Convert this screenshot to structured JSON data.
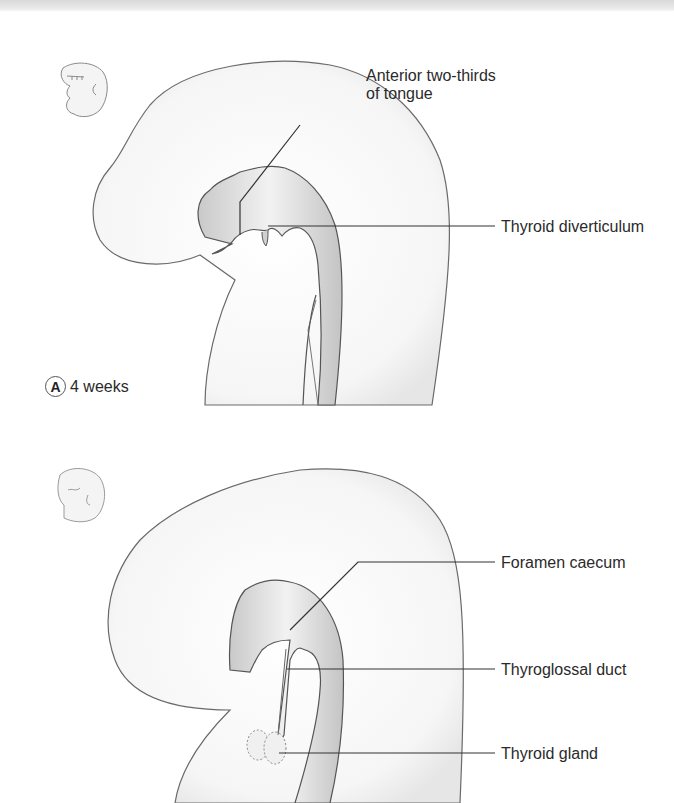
{
  "figure": {
    "panel_a": {
      "letter": "A",
      "age": "4 weeks",
      "labels": {
        "tongue_line1": "Anterior two-thirds",
        "tongue_line2": "of tongue",
        "thyroid_diverticulum": "Thyroid diverticulum"
      }
    },
    "panel_b": {
      "labels": {
        "foramen_caecum": "Foramen caecum",
        "thyroglossal_duct": "Thyroglossal duct",
        "thyroid_gland": "Thyroid gland"
      }
    },
    "colors": {
      "outline": "#6a6a6a",
      "leader": "#333333",
      "tissue_fill": "#f7f7f7",
      "gut_fill": "#e2e2e2"
    }
  }
}
